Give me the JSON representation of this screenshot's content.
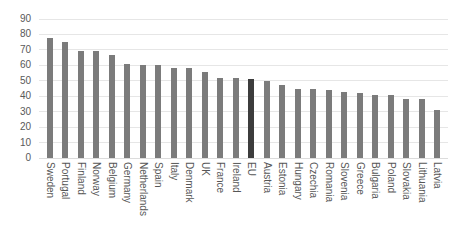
{
  "chart_data": {
    "type": "bar",
    "title": "",
    "xlabel": "",
    "ylabel": "",
    "ylim": [
      0,
      90
    ],
    "yticks": [
      90,
      80,
      70,
      60,
      50,
      40,
      30,
      20,
      10,
      0
    ],
    "grid": true,
    "legend": "none",
    "bar_color": "#7b7b7b",
    "highlight_color": "#3c3c3c",
    "highlight_category": "EU",
    "categories": [
      "Sweden",
      "Portugal",
      "Finland",
      "Norway",
      "Belgium",
      "Germany",
      "Netherlands",
      "Spain",
      "Italy",
      "Denmark",
      "UK",
      "France",
      "Ireland",
      "EU",
      "Austria",
      "Estonia",
      "Hungary",
      "Czechia",
      "Romania",
      "Slovenia",
      "Greece",
      "Bulgaria",
      "Poland",
      "Slovakia",
      "Lithuania",
      "Latvia"
    ],
    "values": [
      78,
      75,
      69,
      69,
      67,
      61,
      60,
      60,
      58,
      58,
      56,
      52,
      52,
      51,
      50,
      47,
      45,
      45,
      44,
      43,
      42,
      41,
      41,
      38,
      38,
      31
    ]
  }
}
